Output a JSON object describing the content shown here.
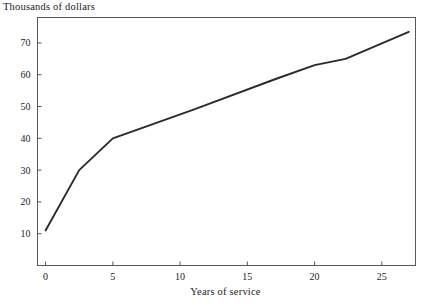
{
  "chart_data": {
    "type": "line",
    "title": "",
    "ylabel": "Thousands of dollars",
    "xlabel": "Years of service",
    "xlim": [
      -0.6,
      27.5
    ],
    "ylim": [
      0,
      78
    ],
    "xticks": [
      0,
      5,
      10,
      15,
      20,
      25
    ],
    "yticks": [
      10,
      20,
      30,
      40,
      50,
      60,
      70
    ],
    "grid": false,
    "legend": null,
    "frame": "box",
    "series": [
      {
        "name": "Salary",
        "x": [
          0,
          2.5,
          5,
          11,
          17,
          20,
          22.3,
          27
        ],
        "values": [
          11,
          30,
          40,
          49,
          58.5,
          63,
          65,
          73.5
        ]
      }
    ],
    "line_color": "#2b2b2b",
    "axis_color": "#555a5e"
  },
  "labels": {
    "ylabel_text": "Thousands of dollars",
    "xlabel_text": "Years of service",
    "ytick_texts": [
      "10",
      "20",
      "30",
      "40",
      "50",
      "60",
      "70"
    ],
    "xtick_texts": [
      "0",
      "5",
      "10",
      "15",
      "20",
      "25"
    ]
  }
}
